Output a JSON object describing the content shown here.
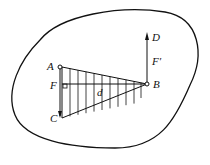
{
  "diagram": {
    "labels": {
      "A": "A",
      "B": "B",
      "C": "C",
      "D": "D",
      "F": "F",
      "F_prime": "F′",
      "d": "d"
    },
    "stroke_color": "#111111",
    "background": "#ffffff"
  }
}
